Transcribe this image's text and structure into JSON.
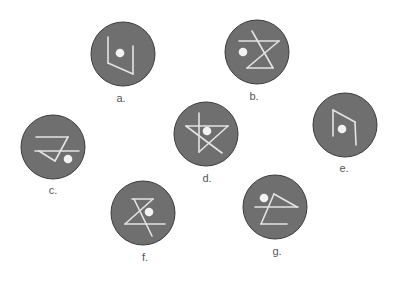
{
  "figure": {
    "colors": {
      "background": "#ffffff",
      "disc_fill": "#6f6f6f",
      "disc_stroke": "#3c3c3c",
      "glyph_stroke": "#e4e4e4",
      "dot_fill": "#f2f2f2",
      "label_text": "#555555"
    },
    "disc_radius": 32,
    "symbols": [
      {
        "id": "a",
        "label": "a.",
        "center": [
          123,
          54
        ],
        "label_pos": [
          121,
          96
        ],
        "dot": [
          -3,
          -1
        ],
        "lines": [
          [
            -15,
            -17,
            -15,
            9
          ],
          [
            -15,
            9,
            10,
            20
          ],
          [
            10,
            20,
            10,
            -8
          ]
        ]
      },
      {
        "id": "b",
        "label": "b.",
        "center": [
          257,
          52
        ],
        "label_pos": [
          254,
          94
        ],
        "dot": [
          -14,
          0
        ],
        "lines": [
          [
            -18,
            -11,
            22,
            -11
          ],
          [
            22,
            -11,
            -10,
            16
          ],
          [
            -10,
            16,
            16,
            16
          ],
          [
            16,
            16,
            -5,
            -21
          ]
        ]
      },
      {
        "id": "c",
        "label": "c.",
        "center": [
          53,
          147
        ],
        "label_pos": [
          53,
          188
        ],
        "dot": [
          15,
          12
        ],
        "lines": [
          [
            -17,
            -10,
            15,
            -10
          ],
          [
            15,
            -10,
            2,
            14
          ],
          [
            2,
            14,
            -14,
            4
          ],
          [
            -18,
            4,
            26,
            4
          ]
        ]
      },
      {
        "id": "d",
        "label": "d.",
        "center": [
          206,
          134
        ],
        "label_pos": [
          207,
          176
        ],
        "dot": [
          1,
          -3
        ],
        "lines": [
          [
            -20,
            -8,
            22,
            -8
          ],
          [
            -20,
            -8,
            16,
            19
          ],
          [
            22,
            -8,
            -7,
            18
          ],
          [
            -7,
            -21,
            -7,
            18
          ]
        ]
      },
      {
        "id": "e",
        "label": "e.",
        "center": [
          345,
          125
        ],
        "label_pos": [
          344,
          166
        ],
        "dot": [
          -3,
          4
        ],
        "lines": [
          [
            -12,
            -15,
            -12,
            11
          ],
          [
            -12,
            -15,
            10,
            -3
          ],
          [
            10,
            -3,
            11,
            20
          ]
        ]
      },
      {
        "id": "f",
        "label": "f.",
        "center": [
          143,
          213
        ],
        "label_pos": [
          145,
          255
        ],
        "dot": [
          6,
          -1
        ],
        "lines": [
          [
            -11,
            -14,
            10,
            -14
          ],
          [
            10,
            -14,
            -18,
            11
          ],
          [
            -18,
            11,
            22,
            11
          ],
          [
            -9,
            -14,
            9,
            23
          ]
        ]
      },
      {
        "id": "g",
        "label": "g.",
        "center": [
          275,
          207
        ],
        "label_pos": [
          277,
          249
        ],
        "dot": [
          -11,
          -9
        ],
        "lines": [
          [
            -20,
            0,
            23,
            0
          ],
          [
            -1,
            -13,
            22,
            0
          ],
          [
            -1,
            -13,
            -14,
            17
          ],
          [
            -14,
            17,
            12,
            17
          ]
        ]
      }
    ]
  }
}
